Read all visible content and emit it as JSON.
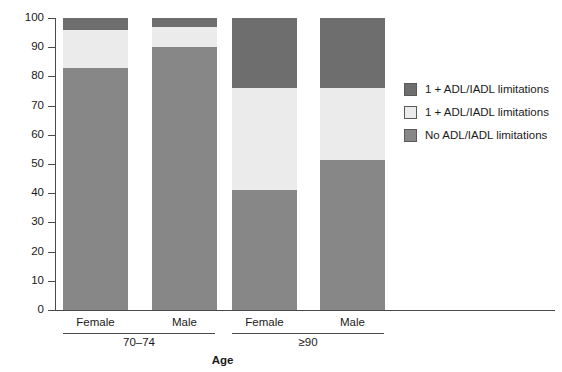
{
  "chart_data": {
    "type": "bar",
    "subtype": "stacked-percent",
    "title": "",
    "xlabel": "Age",
    "ylabel": "",
    "ylim": [
      0,
      100
    ],
    "yticks": [
      0,
      10,
      20,
      30,
      40,
      50,
      60,
      70,
      80,
      90,
      100
    ],
    "grid": false,
    "legend_position": "right",
    "categories": [
      "Female",
      "Male",
      "Female",
      "Male"
    ],
    "groups": [
      {
        "label": "70–74",
        "categories": [
          "Female",
          "Male"
        ]
      },
      {
        "label": "≥90",
        "categories": [
          "Female",
          "Male"
        ]
      }
    ],
    "series": [
      {
        "name": "No ADL/IADL limitations",
        "color": "#878787",
        "values": [
          83,
          90,
          41,
          51.5
        ]
      },
      {
        "name": "1 + ADL/IADL limitations",
        "color": "#ebebeb",
        "values": [
          13,
          7,
          35,
          24.5
        ]
      },
      {
        "name": "1 + ADL/IADL limitations",
        "color": "#6e6e6e",
        "values": [
          4,
          3,
          24,
          24
        ]
      }
    ],
    "bars": [
      {
        "group": "70–74",
        "category": "Female",
        "segments": [
          {
            "series": "No ADL/IADL limitations",
            "start": 0,
            "end": 83
          },
          {
            "series": "1 + ADL/IADL limitations",
            "start": 83,
            "end": 96
          },
          {
            "series": "1 + ADL/IADL limitations",
            "start": 96,
            "end": 100
          }
        ]
      },
      {
        "group": "70–74",
        "category": "Male",
        "segments": [
          {
            "series": "No ADL/IADL limitations",
            "start": 0,
            "end": 90
          },
          {
            "series": "1 + ADL/IADL limitations",
            "start": 90,
            "end": 97
          },
          {
            "series": "1 + ADL/IADL limitations",
            "start": 97,
            "end": 100
          }
        ]
      },
      {
        "group": "≥90",
        "category": "Female",
        "segments": [
          {
            "series": "No ADL/IADL limitations",
            "start": 0,
            "end": 41
          },
          {
            "series": "1 + ADL/IADL limitations",
            "start": 41,
            "end": 76
          },
          {
            "series": "1 + ADL/IADL limitations",
            "start": 76,
            "end": 100
          }
        ]
      },
      {
        "group": "≥90",
        "category": "Male",
        "segments": [
          {
            "series": "No ADL/IADL limitations",
            "start": 0,
            "end": 51.5
          },
          {
            "series": "1 + ADL/IADL limitations",
            "start": 51.5,
            "end": 76
          },
          {
            "series": "1 + ADL/IADL limitations",
            "start": 76,
            "end": 100
          }
        ]
      }
    ]
  },
  "axis": {
    "y_labels": [
      "100",
      "90",
      "80",
      "70",
      "60",
      "50",
      "40",
      "30",
      "20",
      "10",
      "0"
    ],
    "x_title": "Age",
    "category_labels": [
      "Female",
      "Male",
      "Female",
      "Male"
    ],
    "group_labels": [
      "70–74",
      "≥90"
    ]
  },
  "legend": {
    "items": [
      {
        "label": "1 + ADL/IADL limitations",
        "color": "#6e6e6e"
      },
      {
        "label": "1 + ADL/IADL limitations",
        "color": "#ebebeb"
      },
      {
        "label": "No ADL/IADL limitations",
        "color": "#878787"
      }
    ]
  },
  "colors": {
    "dark_gray": "#6e6e6e",
    "light_gray": "#ebebeb",
    "medium_gray": "#878787",
    "axis": "#4a4a4a",
    "text": "#1a1a1a",
    "background": "#ffffff"
  }
}
